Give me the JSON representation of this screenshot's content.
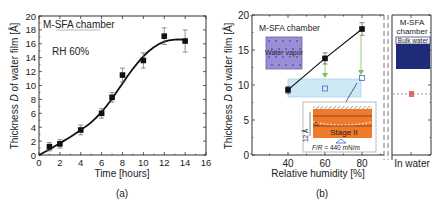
{
  "chart_data": [
    {
      "panel": "(a)",
      "type": "scatter",
      "title": "",
      "annotations": [
        "M-SFA chamber",
        "RH 60%"
      ],
      "xlabel": "Time [hours]",
      "ylabel": "Thickness D of water film [Å]",
      "xlim": [
        0,
        16
      ],
      "ylim": [
        0,
        20
      ],
      "xticks": [
        0,
        2,
        4,
        6,
        8,
        10,
        12,
        14,
        16
      ],
      "yticks": [
        0,
        2,
        4,
        6,
        8,
        10,
        12,
        14,
        16,
        18,
        20
      ],
      "grid": false,
      "series": [
        {
          "name": "Measured thickness",
          "marker": "filled-square",
          "x": [
            1,
            2,
            4,
            6,
            7,
            8,
            10,
            12,
            14
          ],
          "y": [
            1.2,
            1.6,
            3.6,
            6.0,
            8.3,
            11.5,
            13.6,
            17.1,
            16.4
          ],
          "yerr": [
            0.6,
            0.6,
            0.7,
            0.7,
            0.7,
            1.0,
            1.1,
            1.2,
            1.6
          ]
        },
        {
          "name": "Fit curve",
          "type": "line",
          "x": [
            0,
            1,
            2,
            3,
            4,
            5,
            6,
            7,
            8,
            9,
            10,
            11,
            12,
            13,
            14
          ],
          "y": [
            0.0,
            0.8,
            1.7,
            2.6,
            3.6,
            4.7,
            6.2,
            8.1,
            10.3,
            12.4,
            14.2,
            15.5,
            16.3,
            16.6,
            16.6
          ]
        }
      ]
    },
    {
      "panel": "(b)",
      "type": "scatter",
      "title": "",
      "xlabel": "Relative humidity [%]",
      "ylabel": "Thickness D of water film [Å]",
      "xlim": [
        20,
        92
      ],
      "ylim": [
        0,
        20
      ],
      "xticks": [
        40,
        60,
        80
      ],
      "yticks": [
        0,
        5,
        10,
        15,
        20
      ],
      "grid": false,
      "series": [
        {
          "name": "M-SFA chamber (vapor)",
          "marker": "filled-square-line",
          "x": [
            40,
            60,
            80
          ],
          "y": [
            9.3,
            13.8,
            18.0
          ],
          "yerr": [
            0.5,
            0.8,
            0.9
          ]
        },
        {
          "name": "After compression (Stage II)",
          "marker": "open-square",
          "x": [
            60,
            80
          ],
          "y": [
            9.5,
            11.0
          ]
        }
      ],
      "band": {
        "x": [
          40,
          86
        ],
        "y": [
          8.7,
          11.3
        ],
        "color": "#cfe8f6"
      },
      "in_water": {
        "label": "In water",
        "value": 8.9,
        "dashed_line": true
      },
      "annotations": [
        "M-SFA chamber",
        "Water vapor",
        "M-SFA chamber",
        "Bulk water",
        "Stage II",
        "12 Å",
        "F/R = 440 mN/m"
      ]
    }
  ],
  "panel_a": {
    "chamber_label": "M-SFA chamber",
    "rh_label": "RH 60%",
    "xlabel": "Time [hours]",
    "ylabel_pre": "Thickness ",
    "ylabel_var": "D",
    "ylabel_post": " of water film [Å]",
    "caption": "(a)",
    "xticks": [
      "0",
      "2",
      "4",
      "6",
      "8",
      "10",
      "12",
      "14",
      "16"
    ],
    "yticks": [
      "0",
      "2",
      "4",
      "6",
      "8",
      "10",
      "12",
      "14",
      "16",
      "18",
      "20"
    ]
  },
  "panel_b": {
    "chamber_label": "M-SFA chamber",
    "vapor_label": "Water vapor",
    "chamber_label_right_1": "M-SFA",
    "chamber_label_right_2": "chamber",
    "bulk_label": "Bulk water",
    "stage_label": "Stage II",
    "thickness_label": "12 Å",
    "force_label_var": "F/R",
    "force_label_val": " = 440 mN/m",
    "xlabel": "Relative humidity [%]",
    "ylabel_pre": "Thickness ",
    "ylabel_var": "D",
    "ylabel_post": " of water film [Å]",
    "in_water_label": "In water",
    "caption": "(b)",
    "xticks": [
      "40",
      "60",
      "80"
    ],
    "yticks": [
      "0",
      "5",
      "10",
      "15",
      "20"
    ]
  },
  "colors": {
    "axis": "#333333",
    "data": "#111111",
    "vapor_box": "#9a8fd6",
    "bulk_box": "#1f2a78",
    "band": "#cfe8f6",
    "band_edge": "#9cc8e6",
    "orange": "#f07a2a",
    "green_arrow": "#7fbf5a",
    "red_point": "#d9534f",
    "open_square": "#3a6fc0"
  }
}
